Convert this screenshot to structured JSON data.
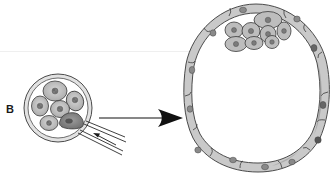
{
  "figure": {
    "panel_label": "B",
    "left_image": {
      "name": "cleavage-stage-embryo",
      "cells": 6,
      "biopsied_cell_shaded": true,
      "tool": "micropipette"
    },
    "arrow": {
      "direction": "right"
    },
    "right_image": {
      "name": "blastocyst",
      "inner_cell_mass_cells": 8,
      "trophectoderm_cells": 14
    },
    "colors": {
      "background": "#ffffff",
      "outline": "#333333",
      "cell_fill": "#c8c8c8",
      "cell_fill_dark": "#9a9a9a",
      "zona_fill": "#d9d9d9",
      "nucleus": "#6b6b6b"
    }
  }
}
